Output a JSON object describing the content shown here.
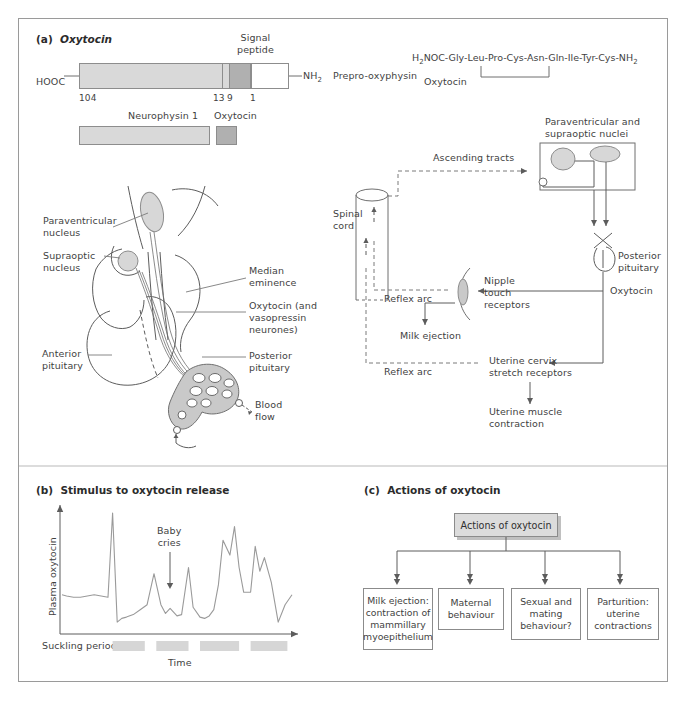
{
  "figure": {
    "panels": {
      "a": {
        "tag": "(a)",
        "title": "Oxytocin"
      },
      "b": {
        "tag": "(b)",
        "title": "Stimulus to oxytocin release"
      },
      "c": {
        "tag": "(c)",
        "title": "Actions of oxytocin"
      }
    }
  },
  "panel_a": {
    "precursor": {
      "c_terminus": "HOOC",
      "n_terminus": "NH",
      "n_terminus_sub": "2",
      "product_label": "Prepro-oxyphysin",
      "signal_peptide_label": "Signal\npeptide",
      "residue_numbers": [
        "104",
        "13",
        "9",
        "1"
      ]
    },
    "mature": {
      "neurophysin_label": "Neurophysin 1",
      "oxytocin_label": "Oxytocin"
    },
    "sequence": {
      "text": "H2NOC-Gly-Leu-Pro-Cys-Asn-Gln-Ile-Tyr-Cys-NH2",
      "prefix": "H",
      "prefix_sub": "2",
      "middle": "NOC-Gly-Leu-Pro-Cys-Asn-Gln-Ile-Tyr-Cys-NH",
      "suffix_sub": "2",
      "name": "Oxytocin",
      "residues": [
        "Gly",
        "Leu",
        "Pro",
        "Cys",
        "Asn",
        "Gln",
        "Ile",
        "Tyr",
        "Cys"
      ]
    },
    "anatomy_labels": {
      "paraventricular_nucleus": "Paraventricular\nnucleus",
      "supraoptic_nucleus": "Supraoptic\nnucleus",
      "median_eminence": "Median\neminence",
      "oxytocin_neurones": "Oxytocin (and\nvasopressin\nneurones)",
      "anterior_pituitary": "Anterior\npituitary",
      "posterior_pituitary": "Posterior\npituitary",
      "blood_flow": "Blood\nflow"
    },
    "reflex_labels": {
      "nuclei_box": "Paraventricular and\nsupraoptic nuclei",
      "ascending_tracts": "Ascending tracts",
      "spinal_cord": "Spinal\ncord",
      "posterior_pituitary": "Posterior\npituitary",
      "oxytocin": "Oxytocin",
      "nipple_touch_receptors": "Nipple\ntouch\nreceptors",
      "reflex_arc_upper": "Reflex arc",
      "reflex_arc_lower": "Reflex arc",
      "milk_ejection": "Milk ejection",
      "uterine_cervix": "Uterine cervix\nstretch receptors",
      "uterine_muscle": "Uterine muscle\ncontraction"
    }
  },
  "chart_data": {
    "type": "line",
    "title": "Stimulus to oxytocin release",
    "xlabel": "Time",
    "ylabel": "Plasma oxytocin",
    "annotation": "Baby\ncries",
    "suckling_label": "Suckling periods",
    "grid": false,
    "legend": false,
    "xlim": [
      0,
      100
    ],
    "ylim": [
      0,
      100
    ],
    "x": [
      0,
      2,
      5,
      8,
      11,
      14,
      17,
      20,
      22,
      24,
      26,
      28,
      31,
      34,
      37,
      40,
      43,
      45,
      47,
      50,
      52,
      55,
      57,
      60,
      62,
      64,
      66,
      68,
      70,
      73,
      75,
      77,
      79,
      82,
      84,
      86,
      88,
      91,
      94,
      97,
      100
    ],
    "values": [
      30,
      29,
      28,
      28,
      29,
      30,
      29,
      28,
      96,
      8,
      11,
      12,
      14,
      18,
      22,
      47,
      22,
      15,
      19,
      13,
      14,
      52,
      20,
      12,
      11,
      13,
      18,
      38,
      74,
      62,
      85,
      52,
      32,
      32,
      69,
      49,
      60,
      40,
      8,
      22,
      30
    ],
    "suckling_periods": [
      {
        "start": 22,
        "end": 36
      },
      {
        "start": 41,
        "end": 55
      },
      {
        "start": 60,
        "end": 77
      },
      {
        "start": 82,
        "end": 98
      }
    ]
  },
  "panel_c": {
    "head": "Actions of oxytocin",
    "nodes": [
      "Milk ejection:\ncontraction of\nmammillary\nmyoepithelium",
      "Maternal\nbehaviour",
      "Sexual and\nmating\nbehaviour?",
      "Parturition:\nuterine\ncontractions"
    ]
  },
  "colors": {
    "neurophysin_fill": "#d9d9d9",
    "oxytocin_fill": "#b0b0b0",
    "signal_fill": "#ffffff",
    "nucleus_fill": "#d7d7d7",
    "suckling_bar": "#d6d6d6",
    "head_fill": "#dcdcdc",
    "line": "#9a9a9a",
    "text": "#3f3f3f",
    "frame": "#9a9a9a"
  }
}
